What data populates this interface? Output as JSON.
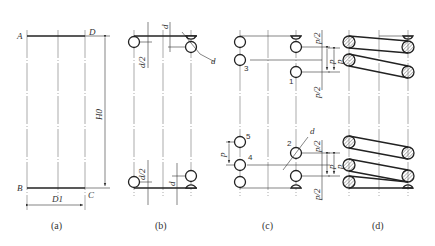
{
  "figure": {
    "panels": [
      {
        "id": "a",
        "caption": "(a)",
        "labels": {
          "A": "A",
          "B": "B",
          "C": "C",
          "D": "D",
          "free_height": "H0",
          "mean_diameter": "D1"
        }
      },
      {
        "id": "b",
        "caption": "(b)",
        "labels": {
          "half_d_top": "d/2",
          "d_top": "d",
          "d_diag": "d",
          "half_d_bottom": "d/2",
          "d_bottom": "d"
        }
      },
      {
        "id": "c",
        "caption": "(c)",
        "labels": {
          "coil_1": "1",
          "coil_2": "2",
          "coil_3": "3",
          "coil_4": "4",
          "coil_5": "5",
          "p_top": "p",
          "p_half_top1": "p/2",
          "p_half_top2": "p/2",
          "p_bottom": "p",
          "p_half_bottom1": "p/2",
          "p_half_bottom2": "p/2",
          "p_left": "p",
          "d_diag": "d"
        }
      },
      {
        "id": "d",
        "caption": "(d)",
        "labels": {
          "p_top": "p",
          "p_bottom": "p"
        }
      }
    ]
  }
}
